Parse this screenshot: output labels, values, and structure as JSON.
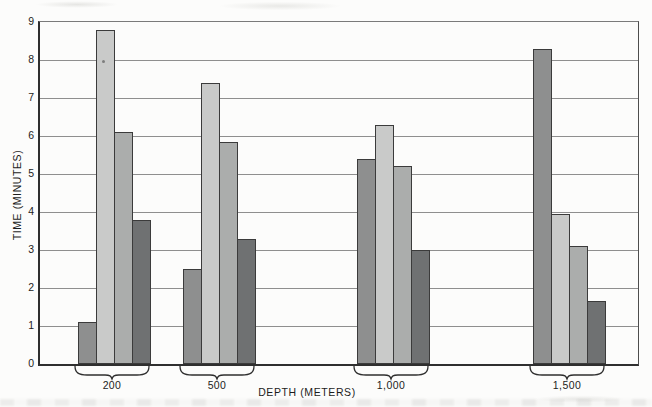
{
  "chart_data": {
    "type": "bar",
    "title": "",
    "xlabel": "DEPTH (METERS)",
    "ylabel": "TIME (MINUTES)",
    "categories": [
      "200",
      "500",
      "1,000",
      "1,500"
    ],
    "categories_numeric": [
      200,
      500,
      1000,
      1500
    ],
    "series": [
      {
        "name": "bar-1-medium-gray",
        "color": "#8e8f8f",
        "values": [
          1.1,
          2.5,
          5.4,
          8.3
        ]
      },
      {
        "name": "bar-2-light-gray",
        "color": "#c9cac9",
        "values": [
          8.8,
          7.4,
          6.3,
          3.95
        ]
      },
      {
        "name": "bar-3-gray",
        "color": "#abadac",
        "values": [
          6.1,
          5.85,
          5.2,
          3.1
        ]
      },
      {
        "name": "bar-4-dark-gray",
        "color": "#6f7172",
        "values": [
          3.8,
          3.3,
          3.0,
          1.65
        ]
      }
    ],
    "ylim": [
      0,
      9
    ],
    "yticks": [
      0,
      1,
      2,
      3,
      4,
      5,
      6,
      7,
      8,
      9
    ],
    "grid": "horizontal",
    "legend": "none",
    "group_style": "clustered-with-underbrace"
  },
  "colors": {
    "bar_outline": "#3b3b3b",
    "gridline": "#7a7a7a",
    "axis": "#2f2f2f",
    "text": "#1c1c1c",
    "background": "#fcfcfb"
  }
}
